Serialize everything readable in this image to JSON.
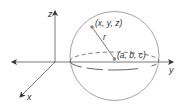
{
  "diagram": {
    "type": "3d-sphere-coordinate-diagram",
    "axes": {
      "z_label": "z",
      "y_label": "y",
      "x_label": "x"
    },
    "points": {
      "surface_point_label": "(x, y, z)",
      "center_label": "(a, b, c)"
    },
    "radius_label": "r",
    "colors": {
      "line": "#555555",
      "point": "#888888",
      "text": "#333333",
      "background": "#ffffff"
    }
  }
}
